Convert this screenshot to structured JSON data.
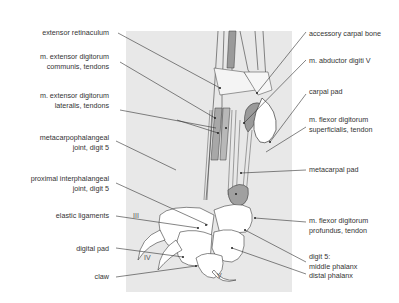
{
  "figure": {
    "colors": {
      "panel": "#e8e8e8",
      "line": "#3a3a3a",
      "tendon_shade": "#9a9a9a",
      "bone": "#ffffff"
    }
  },
  "labels_left": [
    {
      "id": "extensor-retinaculum",
      "lines": [
        "extensor retinaculum"
      ]
    },
    {
      "id": "ext-dig-communis",
      "lines": [
        "m. extensor digitorum",
        "communis, tendons"
      ]
    },
    {
      "id": "ext-dig-lateralis",
      "lines": [
        "m. extensor digitorum",
        "lateralis, tendons"
      ]
    },
    {
      "id": "mcp-joint",
      "lines": [
        "metacarpophalangeal",
        "joint, digit 5"
      ]
    },
    {
      "id": "pip-joint",
      "lines": [
        "proximal interphalangeal",
        "joint, digit 5"
      ]
    },
    {
      "id": "elastic-ligaments",
      "lines": [
        "elastic ligaments"
      ]
    },
    {
      "id": "digital-pad",
      "lines": [
        "digital pad"
      ]
    },
    {
      "id": "claw",
      "lines": [
        "claw"
      ]
    }
  ],
  "labels_right": [
    {
      "id": "accessory-carpal",
      "lines": [
        "accessory carpal bone"
      ]
    },
    {
      "id": "abductor-digiti-v",
      "lines": [
        "m. abductor digiti V"
      ]
    },
    {
      "id": "carpal-pad",
      "lines": [
        "carpal pad"
      ]
    },
    {
      "id": "flexor-superficialis",
      "lines": [
        "m. flexor digitorum",
        "superficialis, tendon"
      ]
    },
    {
      "id": "metacarpal-pad",
      "lines": [
        "metacarpal pad"
      ]
    },
    {
      "id": "flexor-profundus",
      "lines": [
        "m. flexor digitorum",
        "profundus, tendon"
      ]
    },
    {
      "id": "digit5",
      "lines": [
        "digit 5:",
        "middle phalanx",
        "distal phalanx"
      ]
    }
  ],
  "digit_numerals": [
    "III",
    "IV",
    "V"
  ]
}
